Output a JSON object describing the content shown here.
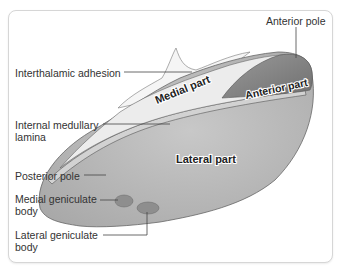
{
  "figure": {
    "labels": {
      "anterior_pole": "Anterior pole",
      "interthalamic_adhesion": "Interthalamic adhesion",
      "internal_medullary_lamina_1": "Internal medullary",
      "internal_medullary_lamina_2": "lamina",
      "posterior_pole": "Posterior pole",
      "medial_geniculate_1": "Medial geniculate",
      "medial_geniculate_2": "body",
      "lateral_geniculate_1": "Lateral geniculate",
      "lateral_geniculate_2": "body"
    },
    "regions": {
      "medial_part": "Medial part",
      "anterior_part": "Anterior part",
      "lateral_part": "Lateral part"
    },
    "colors": {
      "lateral": "#b9b9b9",
      "medial": "#ececec",
      "adhesion": "#f4f4f4",
      "anterior": "#8a8a8a",
      "lamina": "#cfcfcf",
      "geniculate": "#8e8e8e",
      "outline": "#555555"
    }
  }
}
